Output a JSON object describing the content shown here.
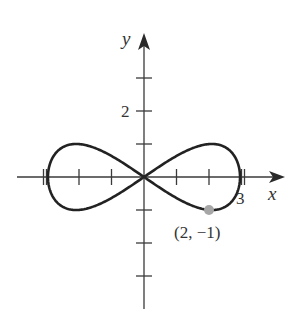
{
  "diagram": {
    "type": "parametric-curve",
    "axes": {
      "x_label": "x",
      "y_label": "y",
      "x_tick_label": "3",
      "y_tick_label": "2",
      "x_ticks": [
        -3,
        -2,
        -1,
        1,
        2,
        3
      ],
      "y_ticks": [
        -3,
        -2,
        -1,
        1,
        2,
        3
      ],
      "xlim": [
        -3.8,
        4.2
      ],
      "ylim": [
        -4,
        4.3
      ]
    },
    "curve": {
      "name": "figure-eight",
      "x_amplitude": 3,
      "y_amplitude": 1,
      "color": "#222222"
    },
    "point": {
      "label": "(2, −1)",
      "x": 2,
      "y": -1,
      "color": "#a6a6a6"
    }
  }
}
